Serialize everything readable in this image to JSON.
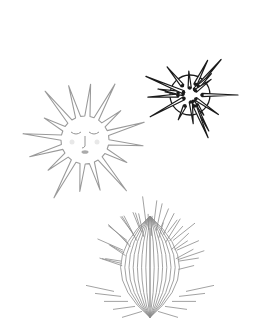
{
  "canvas": {
    "width": 268,
    "height": 334,
    "background": "#ffffff"
  },
  "figures": [
    {
      "id": "sun-face",
      "label": "Sun with sleeping face",
      "cx": 85,
      "cy": 140,
      "rays": 16,
      "inner_r": 24,
      "outer_r": 66,
      "stroke": "#9a9a9a"
    },
    {
      "id": "dark-urchin",
      "label": "Dark spiky sea urchin",
      "cx": 190,
      "cy": 95,
      "body_r": 20,
      "spines": 18,
      "spine_len": 48,
      "stroke": "#1a1a1a"
    },
    {
      "id": "cactus-urchin",
      "label": "Ribbed cactus-like urchin",
      "cx": 150,
      "cy": 268,
      "rx": 42,
      "ry": 52,
      "stroke": "#8a8a8a"
    }
  ]
}
